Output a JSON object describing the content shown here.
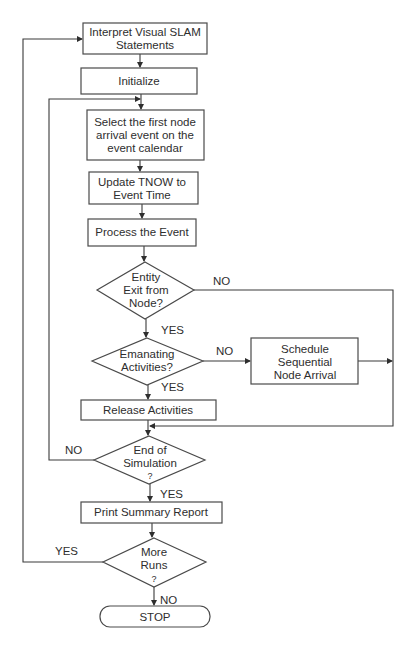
{
  "nodes": {
    "interpret": {
      "type": "process",
      "lines": [
        "Interpret Visual SLAM",
        "Statements"
      ]
    },
    "initialize": {
      "type": "process",
      "lines": [
        "Initialize"
      ]
    },
    "select": {
      "type": "process",
      "lines": [
        "Select the first node",
        "arrival event on the",
        "event calendar"
      ]
    },
    "update": {
      "type": "process",
      "lines": [
        "Update TNOW to",
        "Event Time"
      ]
    },
    "process": {
      "type": "process",
      "lines": [
        "Process the Event"
      ]
    },
    "entity_exit": {
      "type": "decision",
      "lines": [
        "Entity",
        "Exit from",
        "Node?"
      ]
    },
    "emanating": {
      "type": "decision",
      "lines": [
        "Emanating",
        "Activities?"
      ]
    },
    "schedule": {
      "type": "process",
      "lines": [
        "Schedule",
        "Sequential",
        "Node Arrival"
      ]
    },
    "release": {
      "type": "process",
      "lines": [
        "Release Activities"
      ]
    },
    "end_sim": {
      "type": "decision",
      "lines": [
        "End of",
        "Simulation",
        "?"
      ]
    },
    "print": {
      "type": "process",
      "lines": [
        "Print Summary Report"
      ]
    },
    "more_runs": {
      "type": "decision",
      "lines": [
        "More",
        "Runs",
        "?"
      ]
    },
    "stop": {
      "type": "terminator",
      "lines": [
        "STOP"
      ]
    }
  },
  "edges": [
    {
      "from": "interpret",
      "to": "initialize",
      "label": ""
    },
    {
      "from": "initialize",
      "to": "select",
      "label": ""
    },
    {
      "from": "select",
      "to": "update",
      "label": ""
    },
    {
      "from": "update",
      "to": "process",
      "label": ""
    },
    {
      "from": "process",
      "to": "entity_exit",
      "label": ""
    },
    {
      "from": "entity_exit",
      "to": "emanating",
      "label": "YES"
    },
    {
      "from": "entity_exit",
      "to": "end_sim",
      "label": "NO"
    },
    {
      "from": "emanating",
      "to": "release",
      "label": "YES"
    },
    {
      "from": "emanating",
      "to": "schedule",
      "label": "NO"
    },
    {
      "from": "schedule",
      "to": "end_sim",
      "label": ""
    },
    {
      "from": "release",
      "to": "end_sim",
      "label": ""
    },
    {
      "from": "end_sim",
      "to": "print",
      "label": "YES"
    },
    {
      "from": "end_sim",
      "to": "select",
      "label": "NO"
    },
    {
      "from": "print",
      "to": "more_runs",
      "label": ""
    },
    {
      "from": "more_runs",
      "to": "stop",
      "label": "NO"
    },
    {
      "from": "more_runs",
      "to": "interpret",
      "label": "YES"
    }
  ],
  "labels": {
    "yes": "YES",
    "no": "NO"
  }
}
